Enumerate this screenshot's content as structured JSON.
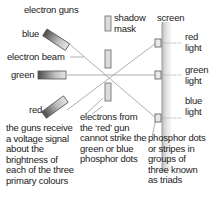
{
  "diagram": {
    "labels": {
      "electron_guns": "electron guns",
      "blue": "blue",
      "electron_beam": "electron beam",
      "green": "green",
      "red": "red",
      "shadow_mask": "shadow\nmask",
      "screen": "screen",
      "red_light": "red\nlight",
      "green_light": "green\nlight",
      "blue_light": "blue\nlight",
      "electrons_note": "electrons from\nthe ‘red’ gun\ncannot strike the\ngreen or blue\nphosphor dots",
      "guns_note": "the guns receive\na voltage signal\nabout the\nbrightness of\neach of the three\nprimary colours",
      "phosphor_note": "phosphor dots\nor stripes in\ngroups of\nthree known\nas triads"
    },
    "colors": {
      "line": "#8a8a8a",
      "gun_dark": "#555555",
      "gun_light": "#d8d8d8",
      "screen_fill": "#dcdcdc",
      "text": "#1a1a1a"
    }
  }
}
